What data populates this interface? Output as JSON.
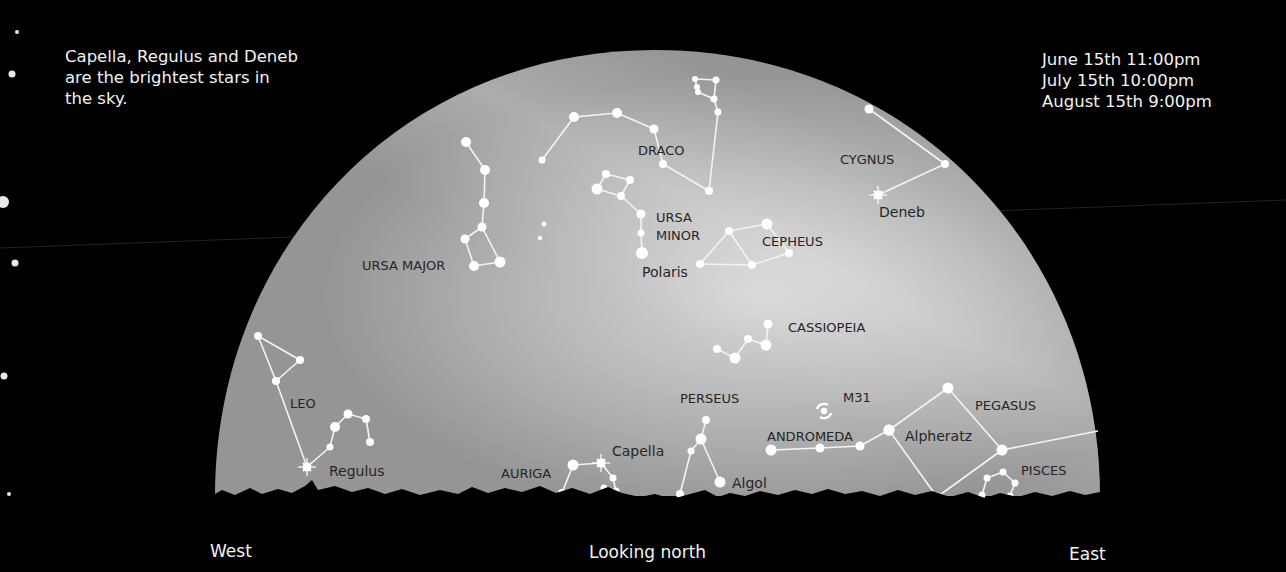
{
  "captions": {
    "note_lines": [
      "Capella, Regulus and Deneb",
      "are the brightest stars in",
      "the sky."
    ],
    "time_lines": [
      "June 15th 11:00pm",
      "July 15th 10:00pm",
      "August 15th 9:00pm"
    ]
  },
  "directions": {
    "west": "West",
    "center": "Looking north",
    "east": "East"
  },
  "colors": {
    "background": "#000000",
    "sky_dome": "#9a9a9a",
    "sky_glow": "#d8d8d8",
    "star": "#ffffff",
    "label": "#262626",
    "caption": "#f2f2f2"
  },
  "constellations": [
    {
      "name": "URSA MAJOR",
      "label_pos": [
        362,
        270
      ],
      "stars": [
        [
          466,
          142,
          5
        ],
        [
          485,
          170,
          5
        ],
        [
          484,
          203,
          5
        ],
        [
          482,
          227,
          4.5
        ],
        [
          465,
          239,
          4.5
        ],
        [
          474,
          266,
          5
        ],
        [
          500,
          262,
          5.5
        ]
      ],
      "lines": [
        [
          0,
          1
        ],
        [
          1,
          2
        ],
        [
          2,
          3
        ],
        [
          3,
          4
        ],
        [
          4,
          5
        ],
        [
          5,
          6
        ],
        [
          6,
          3
        ]
      ]
    },
    {
      "name": "DRACO",
      "label_pos": [
        638,
        155
      ],
      "stars": [
        [
          542,
          160,
          3.5
        ],
        [
          574,
          117,
          5
        ],
        [
          617,
          113,
          5
        ],
        [
          654,
          129,
          4.5
        ],
        [
          663,
          164,
          4
        ],
        [
          709,
          191,
          4
        ],
        [
          718,
          112,
          3.5
        ],
        [
          714,
          99,
          3.5
        ],
        [
          697,
          87,
          3
        ],
        [
          698,
          92,
          3
        ],
        [
          716,
          80,
          3.5
        ],
        [
          695,
          79,
          3
        ]
      ],
      "lines": [
        [
          0,
          1
        ],
        [
          1,
          2
        ],
        [
          2,
          3
        ],
        [
          3,
          4
        ],
        [
          4,
          5
        ],
        [
          5,
          6
        ],
        [
          6,
          7
        ],
        [
          7,
          10
        ],
        [
          10,
          11
        ],
        [
          11,
          9
        ],
        [
          9,
          7
        ]
      ]
    },
    {
      "name": "URSA MINOR",
      "label_lines": [
        "URSA",
        "MINOR"
      ],
      "label_pos": [
        656,
        222
      ],
      "stars": [
        [
          597,
          189,
          5.5
        ],
        [
          606,
          174,
          4
        ],
        [
          630,
          180,
          4
        ],
        [
          621,
          196,
          4
        ],
        [
          641,
          214,
          4.5
        ],
        [
          641,
          233,
          3.5
        ],
        [
          642,
          253,
          6
        ]
      ],
      "lines": [
        [
          0,
          1
        ],
        [
          1,
          2
        ],
        [
          2,
          3
        ],
        [
          3,
          0
        ],
        [
          3,
          4
        ],
        [
          4,
          5
        ],
        [
          5,
          6
        ]
      ]
    },
    {
      "name": "CEPHEUS",
      "label_pos": [
        762,
        246
      ],
      "stars": [
        [
          700,
          264,
          4
        ],
        [
          729,
          231,
          4
        ],
        [
          767,
          224,
          5.5
        ],
        [
          789,
          253,
          4
        ],
        [
          752,
          265,
          4
        ]
      ],
      "lines": [
        [
          0,
          1
        ],
        [
          1,
          2
        ],
        [
          2,
          3
        ],
        [
          3,
          4
        ],
        [
          4,
          0
        ],
        [
          1,
          4
        ]
      ]
    },
    {
      "name": "CYGNUS",
      "label_pos": [
        840,
        164
      ],
      "stars": [
        [
          869,
          109,
          4.5
        ],
        [
          945,
          164,
          4
        ],
        [
          878,
          195,
          4
        ]
      ],
      "lines": [
        [
          0,
          1
        ],
        [
          1,
          2
        ]
      ]
    },
    {
      "name": "CASSIOPEIA",
      "label_pos": [
        788,
        332
      ],
      "stars": [
        [
          768,
          324,
          4.5
        ],
        [
          766,
          345,
          5.5
        ],
        [
          748,
          339,
          4
        ],
        [
          735,
          358,
          5.5
        ],
        [
          717,
          349,
          4
        ]
      ],
      "lines": [
        [
          0,
          1
        ],
        [
          1,
          2
        ],
        [
          2,
          3
        ],
        [
          3,
          4
        ]
      ]
    },
    {
      "name": "LEO",
      "label_pos": [
        290,
        408
      ],
      "stars": [
        [
          258,
          336,
          4
        ],
        [
          300,
          360,
          4
        ],
        [
          276,
          381,
          4
        ],
        [
          307,
          467,
          4
        ],
        [
          330,
          447,
          3.5
        ],
        [
          335,
          427,
          5
        ],
        [
          348,
          414,
          4.5
        ],
        [
          366,
          419,
          4
        ],
        [
          370,
          442,
          4
        ]
      ],
      "lines": [
        [
          0,
          1
        ],
        [
          1,
          2
        ],
        [
          0,
          2
        ],
        [
          2,
          3
        ],
        [
          3,
          4
        ],
        [
          4,
          5
        ],
        [
          5,
          6
        ],
        [
          6,
          7
        ],
        [
          7,
          8
        ]
      ]
    },
    {
      "name": "PERSEUS",
      "label_pos": [
        680,
        403
      ],
      "stars": [
        [
          706,
          420,
          4
        ],
        [
          701,
          439,
          5.5
        ],
        [
          691,
          451,
          3.5
        ],
        [
          720,
          482,
          5.5
        ],
        [
          680,
          494,
          4
        ]
      ],
      "lines": [
        [
          0,
          1
        ],
        [
          1,
          2
        ],
        [
          2,
          4
        ],
        [
          1,
          3
        ]
      ]
    },
    {
      "name": "AURIGA",
      "label_pos": [
        501,
        478
      ],
      "stars": [
        [
          573,
          465,
          5.5
        ],
        [
          601,
          463,
          4
        ],
        [
          613,
          478,
          3.5
        ],
        [
          604,
          488,
          3.5
        ],
        [
          616,
          491,
          3.5
        ],
        [
          562,
          493,
          4
        ]
      ],
      "lines": [
        [
          0,
          1
        ],
        [
          1,
          2
        ],
        [
          2,
          4
        ],
        [
          4,
          3
        ],
        [
          0,
          5
        ]
      ]
    },
    {
      "name": "PEGASUS",
      "label_pos": [
        975,
        410
      ],
      "stars": [
        [
          889,
          430,
          5.5
        ],
        [
          948,
          388,
          5.5
        ],
        [
          1002,
          450,
          5.5
        ],
        [
          937,
          497,
          4.5
        ],
        [
          1098,
          431,
          1
        ]
      ],
      "lines": [
        [
          0,
          1
        ],
        [
          1,
          2
        ],
        [
          2,
          3
        ],
        [
          3,
          0
        ],
        [
          2,
          4
        ]
      ]
    },
    {
      "name": "ANDROMEDA",
      "label_pos": [
        767,
        441
      ],
      "stars": [
        [
          771,
          450,
          5.5
        ],
        [
          820,
          448,
          4.5
        ],
        [
          860,
          446,
          4.5
        ],
        [
          889,
          430,
          5.5
        ]
      ],
      "lines": [
        [
          0,
          1
        ],
        [
          1,
          2
        ],
        [
          2,
          3
        ]
      ]
    },
    {
      "name": "PISCES",
      "label_pos": [
        1021,
        475
      ],
      "stars": [
        [
          987,
          478,
          3.5
        ],
        [
          1003,
          472,
          3.5
        ],
        [
          1015,
          483,
          3.5
        ],
        [
          1010,
          496,
          3.5
        ],
        [
          998,
          500,
          3.5
        ],
        [
          982,
          495,
          3.5
        ]
      ],
      "lines": [
        [
          0,
          1
        ],
        [
          1,
          2
        ],
        [
          2,
          3
        ],
        [
          3,
          4
        ],
        [
          5,
          0
        ]
      ]
    }
  ],
  "bright_stars": [
    {
      "name": "Deneb",
      "pos": [
        878,
        195
      ],
      "label_pos": [
        879,
        217
      ]
    },
    {
      "name": "Polaris",
      "pos": [
        642,
        253
      ],
      "label_pos": [
        642,
        277
      ]
    },
    {
      "name": "Regulus",
      "pos": [
        307,
        467
      ],
      "label_pos": [
        329,
        476
      ]
    },
    {
      "name": "Capella",
      "pos": [
        601,
        463
      ],
      "label_pos": [
        612,
        456
      ]
    },
    {
      "name": "Algol",
      "pos": [
        720,
        482
      ],
      "label_pos": [
        732,
        488
      ]
    },
    {
      "name": "Alpheratz",
      "pos": [
        889,
        430
      ],
      "label_pos": [
        905,
        441
      ]
    }
  ],
  "deep_sky_objects": [
    {
      "name": "M31",
      "pos": [
        824,
        411
      ],
      "label_pos": [
        843,
        402
      ]
    }
  ],
  "loose_stars": [
    [
      544,
      224,
      2.5
    ],
    [
      540,
      238,
      2.2
    ]
  ],
  "edge_stars": [
    [
      17,
      32,
      2
    ],
    [
      12,
      74,
      3.5
    ],
    [
      3,
      202,
      6
    ],
    [
      15,
      263,
      3.5
    ],
    [
      4,
      376,
      3.5
    ],
    [
      9,
      494,
      2
    ]
  ]
}
